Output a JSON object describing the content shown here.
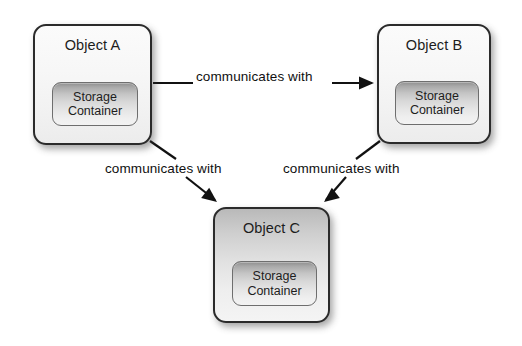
{
  "diagram": {
    "background_color": "#ffffff",
    "line_color": "#111111",
    "border_color": "#2b2b2b",
    "nodes": [
      {
        "id": "object-a",
        "title": "Object A",
        "storage_line1": "Storage",
        "storage_line2": "Container",
        "x": 33,
        "y": 24,
        "w": 119,
        "h": 121,
        "shade": "shade-light",
        "storage": {
          "x": 17,
          "y": 56,
          "w": 86,
          "h": 44
        }
      },
      {
        "id": "object-b",
        "title": "Object B",
        "storage_line1": "Storage",
        "storage_line2": "Container",
        "x": 377,
        "y": 24,
        "w": 114,
        "h": 120,
        "shade": "shade-light",
        "storage": {
          "x": 16,
          "y": 55,
          "w": 84,
          "h": 44
        }
      },
      {
        "id": "object-c",
        "title": "Object C",
        "storage_line1": "Storage",
        "storage_line2": "Container",
        "x": 213,
        "y": 207,
        "w": 117,
        "h": 116,
        "shade": "shade-gray",
        "storage": {
          "x": 17,
          "y": 52,
          "w": 85,
          "h": 45
        }
      }
    ],
    "edges": [
      {
        "id": "a-to-b",
        "label": "communicates with",
        "from": "object-a",
        "to": "object-b",
        "label_x": 196,
        "label_y": 69,
        "segments": [
          {
            "x1": 153,
            "y1": 83,
            "x2": 193,
            "y2": 83
          },
          {
            "x1": 332,
            "y1": 83,
            "x2": 372,
            "y2": 83
          }
        ],
        "arrow": {
          "x": 374,
          "y": 83,
          "angle": 0
        }
      },
      {
        "id": "a-to-c",
        "label": "communicates with",
        "from": "object-a",
        "to": "object-c",
        "label_x": 105,
        "label_y": 161,
        "segments": [
          {
            "x1": 150,
            "y1": 141,
            "x2": 176,
            "y2": 159
          },
          {
            "x1": 186,
            "y1": 177,
            "x2": 215,
            "y2": 200
          }
        ],
        "arrow": {
          "x": 217,
          "y": 202,
          "angle": 38
        }
      },
      {
        "id": "b-to-c",
        "label": "communicates with",
        "from": "object-b",
        "to": "object-c",
        "label_x": 283,
        "label_y": 161,
        "segments": [
          {
            "x1": 380,
            "y1": 141,
            "x2": 356,
            "y2": 159
          },
          {
            "x1": 346,
            "y1": 177,
            "x2": 326,
            "y2": 200
          }
        ],
        "arrow": {
          "x": 324,
          "y": 202,
          "angle": 142
        }
      }
    ]
  }
}
